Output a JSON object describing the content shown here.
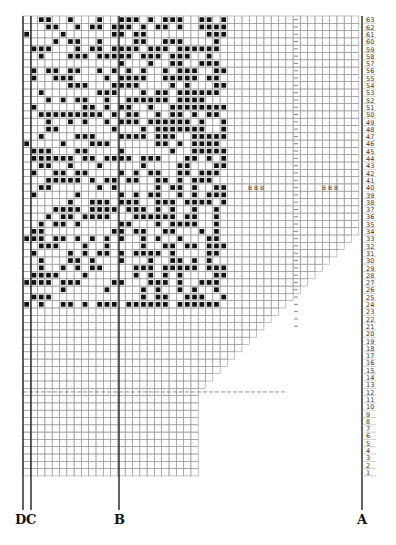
{
  "diagram": {
    "type": "knitting-chart",
    "total_rows": 63,
    "row_numbers_side": "right",
    "row_numbers_order": "descending-top-to-bottom",
    "pattern_rows": 40,
    "pattern_cols": 28,
    "markers": [
      {
        "text": "B B B",
        "row": 40,
        "position": "middle"
      },
      {
        "text": "B B B",
        "row": 40,
        "position": "right"
      }
    ],
    "guide_lines": [
      {
        "label": "D",
        "x": 23
      },
      {
        "label": "C",
        "x": 31
      },
      {
        "label": "B",
        "x": 119
      },
      {
        "label": "A",
        "x": 362
      }
    ],
    "dashed_horizontal_row": 11,
    "dashed_vertical_x": 296
  },
  "labels": {
    "d": "D",
    "c": "C",
    "b": "B",
    "a": "A"
  },
  "colors": {
    "grid": "#9a9a9a",
    "stitch": "#111111",
    "line": "#222222"
  }
}
